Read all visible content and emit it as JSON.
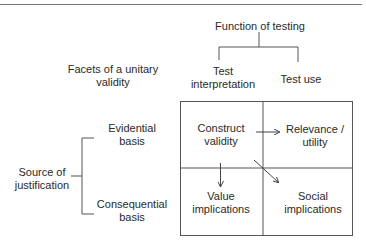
{
  "diagram": {
    "title_left": {
      "line1": "Facets of a unitary",
      "line2": "validity"
    },
    "column_header": "Function of testing",
    "columns": [
      {
        "line1": "Test",
        "line2": "interpretation"
      },
      {
        "line1": "Test use"
      }
    ],
    "row_header": {
      "line1": "Source of",
      "line2": "justification"
    },
    "rows": [
      {
        "line1": "Evidential",
        "line2": "basis"
      },
      {
        "line1": "Consequential",
        "line2": "basis"
      }
    ],
    "cells": [
      {
        "line1": "Construct",
        "line2": "validity"
      },
      {
        "line1": "Relevance /",
        "line2": "utility"
      },
      {
        "line1": "Value",
        "line2": "implications"
      },
      {
        "line1": "Social",
        "line2": "implications"
      }
    ],
    "arrows": [
      {
        "from": "Construct validity",
        "to": "Relevance / utility",
        "direction": "right"
      },
      {
        "from": "Construct validity",
        "to": "Value implications",
        "direction": "down"
      },
      {
        "from": "Construct validity",
        "to": "Social implications",
        "direction": "diagonal"
      }
    ],
    "line_color": "#555555"
  }
}
